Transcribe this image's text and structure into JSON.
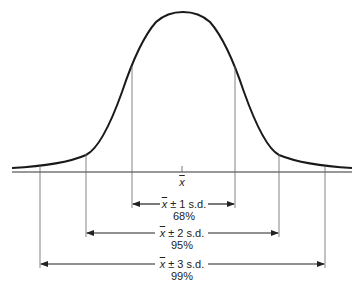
{
  "diagram": {
    "type": "normal-distribution",
    "center_label": "x",
    "ranges": [
      {
        "label_prefix": "x",
        "label": "± 1 s.d.",
        "percent": "68%"
      },
      {
        "label_prefix": "x",
        "label": "± 2 s.d.",
        "percent": "95%"
      },
      {
        "label_prefix": "x",
        "label": "± 3 s.d.",
        "percent": "99%"
      }
    ],
    "colors": {
      "curve": "#1a1a1a",
      "lines": "#555555"
    }
  }
}
